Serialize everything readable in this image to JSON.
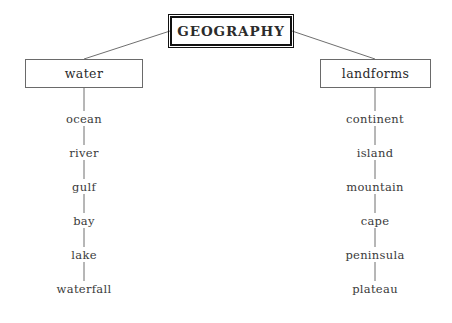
{
  "diagram": {
    "title": "GEOGRAPHY",
    "root": {
      "label": "GEOGRAPHY",
      "x": 170,
      "y": 16,
      "width": 122,
      "height": 30
    },
    "branches": [
      {
        "label": "water",
        "box": {
          "x": 25,
          "y": 59,
          "width": 118,
          "height": 29
        },
        "stem_x": 84,
        "leaves": [
          {
            "label": "ocean",
            "y": 120
          },
          {
            "label": "river",
            "y": 154
          },
          {
            "label": "gulf",
            "y": 188
          },
          {
            "label": "bay",
            "y": 222
          },
          {
            "label": "lake",
            "y": 256
          },
          {
            "label": "waterfall",
            "y": 290
          }
        ]
      },
      {
        "label": "landforms",
        "box": {
          "x": 320,
          "y": 59,
          "width": 111,
          "height": 29
        },
        "stem_x": 375,
        "leaves": [
          {
            "label": "continent",
            "y": 120
          },
          {
            "label": "island",
            "y": 154
          },
          {
            "label": "mountain",
            "y": 188
          },
          {
            "label": "cape",
            "y": 222
          },
          {
            "label": "peninsula",
            "y": 256
          },
          {
            "label": "plateau",
            "y": 290
          }
        ]
      }
    ],
    "colors": {
      "background": "#ffffff",
      "root_border": "#111111",
      "branch_border": "#6a6a6a",
      "connector": "#6f6f6f",
      "text": "#2b2b2b"
    }
  }
}
